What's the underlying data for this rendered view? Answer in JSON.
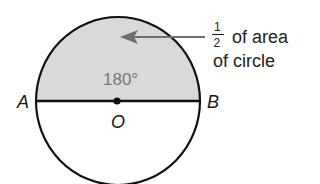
{
  "diagram": {
    "type": "circle-semicircle-area",
    "circle": {
      "center_label": "O",
      "diameter_endpoints": [
        "A",
        "B"
      ],
      "shaded_region": "upper semicircle",
      "colors": {
        "stroke": "#111111",
        "shade": "#d9d9d9",
        "arrow": "#6e6e6e",
        "angle_text": "#777777"
      }
    },
    "labels": {
      "point_a": "A",
      "point_b": "B",
      "center": "O",
      "angle": "180°"
    },
    "annotation": {
      "fraction_numerator": "1",
      "fraction_denominator": "2",
      "line1_rest": "of area",
      "line2": "of circle"
    }
  }
}
